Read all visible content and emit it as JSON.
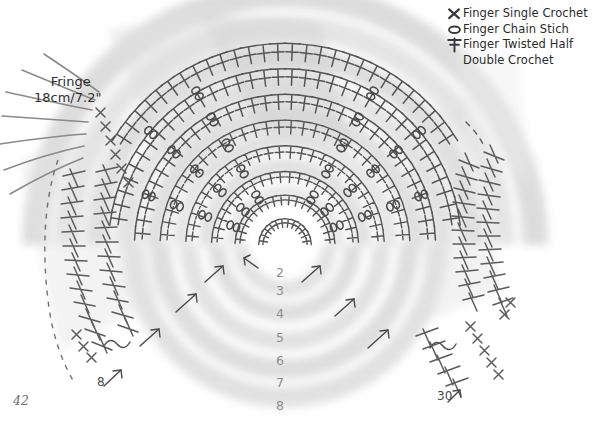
{
  "page": {
    "page_number": "42",
    "background_color": "#ffffff",
    "ink_color": "#4a4a4a",
    "light_ink_color": "#8d8d8d",
    "fabric_color": "#d8d8d8"
  },
  "legend": {
    "items": [
      {
        "icon": "cross-x-icon",
        "label": "Finger Single Crochet"
      },
      {
        "icon": "oval-chain-icon",
        "label": "Finger Chain Stich"
      },
      {
        "icon": "twisted-half-double-icon",
        "label": "Finger Twisted Half"
      },
      {
        "icon": "none",
        "label": "Double Crochet"
      }
    ]
  },
  "fringe": {
    "title": "Fringe",
    "measurement": "18cm/7.2\""
  },
  "row_numbers": [
    {
      "label": "2",
      "x": 272,
      "y": 265
    },
    {
      "label": "3",
      "x": 272,
      "y": 283
    },
    {
      "label": "4",
      "x": 272,
      "y": 306
    },
    {
      "label": "5",
      "x": 272,
      "y": 330
    },
    {
      "label": "6",
      "x": 272,
      "y": 353
    },
    {
      "label": "7",
      "x": 272,
      "y": 375
    },
    {
      "label": "8",
      "x": 272,
      "y": 398
    }
  ],
  "edge_labels": [
    {
      "name": "left-stitch-count",
      "label": "8",
      "x": 97,
      "y": 375
    },
    {
      "name": "right-stitch-count",
      "label": "30",
      "x": 437,
      "y": 389
    }
  ],
  "chart_data": {
    "type": "diagram",
    "center": {
      "x": 285,
      "y": 245
    },
    "rings": [
      {
        "row": 1,
        "radius": 22,
        "stitch": "twisted-half-double",
        "count": 12
      },
      {
        "row": 2,
        "radius": 45,
        "stitch": "twisted-half-double",
        "count": 18
      },
      {
        "row": 3,
        "radius": 68,
        "stitch": "twisted-half-double",
        "count": 22
      },
      {
        "row": 4,
        "radius": 93,
        "stitch": "twisted-half-double",
        "count": 26
      },
      {
        "row": 5,
        "radius": 118,
        "stitch": "twisted-half-double",
        "count": 30
      },
      {
        "row": 6,
        "radius": 143,
        "stitch": "twisted-half-double",
        "count": 34
      },
      {
        "row": 7,
        "radius": 168,
        "stitch": "twisted-half-double",
        "count": 38
      },
      {
        "row": 8,
        "radius": 193,
        "stitch": "twisted-half-double",
        "count": 42
      }
    ],
    "angle_start_deg": 182,
    "angle_end_deg": 358,
    "fringe_strands": 7,
    "direction_arrows": 7
  }
}
